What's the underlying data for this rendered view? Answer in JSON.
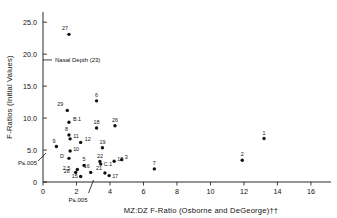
{
  "chart_data": {
    "type": "scatter",
    "title": "",
    "xlabel": "MZ:DZ  F-Ratio (Osborne and DeGeorge)††",
    "ylabel": "F-Ratios (Initial Values)",
    "xlim": [
      0,
      17.2
    ],
    "ylim": [
      0,
      26.6
    ],
    "grid": false,
    "legend": "none",
    "xticks": [
      0,
      2,
      4,
      6,
      8,
      10,
      12,
      14,
      16
    ],
    "xticklabels": [
      "0",
      "2",
      "4",
      "6",
      "8",
      "10",
      "12",
      "14",
      "16"
    ],
    "yticks": [
      0,
      5.0,
      10.0,
      15.0,
      20.0,
      25.0
    ],
    "yticklabels": [
      "0",
      "5.0",
      "10.0",
      "15.0",
      "20.0",
      "25.0"
    ],
    "annotations": [
      {
        "name": "nasal-depth-reference",
        "text": "Nasal Depth (23)",
        "axis": "y",
        "value": 19.1,
        "style": "tick-with-label"
      },
      {
        "name": "y-significance-marker",
        "text": "P≤.005",
        "axis": "y",
        "value": 3.9,
        "style": "slash-tick"
      },
      {
        "name": "x-significance-marker",
        "text": "P≤.005",
        "axis": "x",
        "value": 2.9,
        "style": "slash-tick"
      }
    ],
    "points": [
      {
        "label": "27",
        "x": 1.55,
        "y": 23.1,
        "label_dx": -1,
        "label_dy": -4
      },
      {
        "label": "6",
        "x": 3.2,
        "y": 12.7,
        "label_dx": 0,
        "label_dy": -4
      },
      {
        "label": "29",
        "x": 1.45,
        "y": 11.2,
        "label_dx": -4,
        "label_dy": -4
      },
      {
        "label": "B.1",
        "x": 1.55,
        "y": 9.35,
        "label_dx": 4,
        "label_dy": -1
      },
      {
        "label": "26",
        "x": 4.3,
        "y": 8.8,
        "label_dx": 0,
        "label_dy": -4
      },
      {
        "label": "18",
        "x": 3.2,
        "y": 8.45,
        "label_dx": 0,
        "label_dy": -4
      },
      {
        "label": "8",
        "x": 1.55,
        "y": 7.35,
        "label_dx": -1,
        "label_dy": -4
      },
      {
        "label": "11",
        "x": 1.62,
        "y": 6.75,
        "label_dx": 3,
        "label_dy": -1
      },
      {
        "label": "1",
        "x": 13.2,
        "y": 6.8,
        "label_dx": 0,
        "label_dy": -4
      },
      {
        "label": "12",
        "x": 2.25,
        "y": 6.2,
        "label_dx": 4,
        "label_dy": -1
      },
      {
        "label": "9",
        "x": 0.8,
        "y": 5.55,
        "label_dx": -1,
        "label_dy": -4
      },
      {
        "label": "19",
        "x": 3.55,
        "y": 5.35,
        "label_dx": 0,
        "label_dy": -4
      },
      {
        "label": "10",
        "x": 1.62,
        "y": 4.85,
        "label_dx": 3,
        "label_dy": 0
      },
      {
        "label": "D",
        "x": 1.55,
        "y": 3.7,
        "label_dx": -5,
        "label_dy": 0
      },
      {
        "label": "3",
        "x": 4.7,
        "y": 3.5,
        "label_dx": 3,
        "label_dy": -1
      },
      {
        "label": "13",
        "x": 4.25,
        "y": 3.25,
        "label_dx": 3,
        "label_dy": 0
      },
      {
        "label": "22",
        "x": 3.4,
        "y": 3.2,
        "label_dx": 0,
        "label_dy": -4
      },
      {
        "label": "2",
        "x": 11.9,
        "y": 3.4,
        "label_dx": 0,
        "label_dy": -4
      },
      {
        "label": "5",
        "x": 2.45,
        "y": 2.6,
        "label_dx": 0,
        "label_dy": -4
      },
      {
        "label": "C.1",
        "x": 3.45,
        "y": 2.8,
        "label_dx": 3,
        "label_dy": 2
      },
      {
        "label": "7",
        "x": 6.65,
        "y": 2.05,
        "label_dx": 0,
        "label_dy": -4
      },
      {
        "label": "2.5",
        "x": 2.05,
        "y": 1.95,
        "label_dx": -7,
        "label_dy": 0
      },
      {
        "label": "28",
        "x": 1.95,
        "y": 1.5,
        "label_dx": -6,
        "label_dy": 1
      },
      {
        "label": "16",
        "x": 2.85,
        "y": 1.5,
        "label_dx": -1,
        "label_dy": -4
      },
      {
        "label": "21",
        "x": 3.7,
        "y": 1.4,
        "label_dx": -3,
        "label_dy": -3
      },
      {
        "label": "17",
        "x": 3.95,
        "y": 1.0,
        "label_dx": 3,
        "label_dy": 2
      },
      {
        "label": "15",
        "x": 2.25,
        "y": 0.85,
        "label_dx": -3,
        "label_dy": 1
      }
    ]
  }
}
